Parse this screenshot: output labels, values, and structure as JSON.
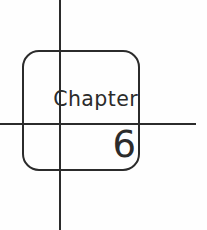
{
  "page": {
    "kind": "chapter-divider",
    "background_color": "#fefefe",
    "ink_color": "#2b2b2b"
  },
  "frame": {
    "shape": "rounded-square",
    "corner_radius_px": 17,
    "stroke_width_px": 2.4
  },
  "rules": {
    "vertical": {
      "label": "vertical-rule",
      "x_px": 59,
      "stroke_width_px": 2.4
    },
    "horizontal": {
      "label": "horizontal-rule",
      "y_px": 123,
      "stroke_width_px": 2.4
    }
  },
  "content": {
    "chapter_label": "Chapter",
    "chapter_number": "6"
  }
}
